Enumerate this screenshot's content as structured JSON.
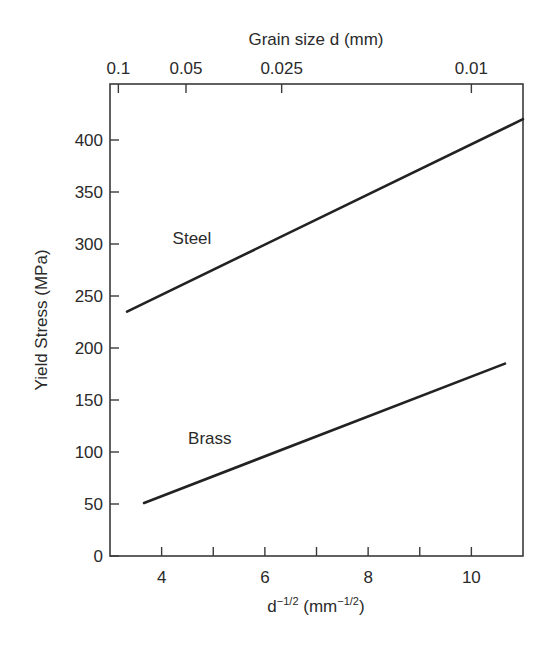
{
  "chart_data": {
    "type": "line",
    "title": "",
    "xlabel": "d^-1/2 (mm^-1/2)",
    "xlabel_parts": {
      "base": "d",
      "base_exp": "−1/2",
      "unit_open": " (mm",
      "unit_exp": "−1/2",
      "unit_close": ")"
    },
    "ylabel": "Yield Stress (MPa)",
    "top_xlabel": "Grain size d (mm)",
    "xlim": [
      3,
      11
    ],
    "ylim": [
      0,
      430
    ],
    "grid": false,
    "legend": "none (inline labels)",
    "x_ticks": [
      4,
      5,
      6,
      7,
      8,
      9,
      10
    ],
    "x_tick_labels": [
      {
        "value": 4,
        "label": "4"
      },
      {
        "value": 6,
        "label": "6"
      },
      {
        "value": 8,
        "label": "8"
      },
      {
        "value": 10,
        "label": "10"
      }
    ],
    "y_ticks": [
      0,
      50,
      100,
      150,
      200,
      250,
      300,
      350,
      400
    ],
    "y_tick_labels": [
      "0",
      "50",
      "100",
      "150",
      "200",
      "250",
      "300",
      "350",
      "400"
    ],
    "top_ticks": [
      {
        "d_mm": 0.1,
        "x": 3.162,
        "label": "0.1"
      },
      {
        "d_mm": 0.05,
        "x": 4.472,
        "label": "0.05"
      },
      {
        "d_mm": 0.025,
        "x": 6.325,
        "label": "0.025"
      },
      {
        "d_mm": 0.01,
        "x": 10.0,
        "label": "0.01"
      }
    ],
    "series": [
      {
        "name": "Steel",
        "color": "#222222",
        "x": [
          3.33,
          11.0
        ],
        "y": [
          235,
          420
        ],
        "label_pos": {
          "x": 4.6,
          "y": 300
        }
      },
      {
        "name": "Brass",
        "color": "#222222",
        "x": [
          3.66,
          10.65
        ],
        "y": [
          51,
          185
        ],
        "label_pos": {
          "x": 4.9,
          "y": 108
        }
      }
    ]
  }
}
